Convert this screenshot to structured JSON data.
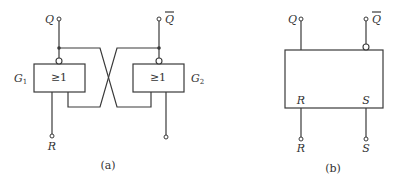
{
  "diagram_a": {
    "caption": "(a)",
    "gate1": {
      "label": "G",
      "subscript": "1",
      "symbol": "≥1"
    },
    "gate2": {
      "label": "G",
      "subscript": "2",
      "symbol": "≥1"
    },
    "output_q": "Q",
    "output_qbar": "Q",
    "input_r": "R"
  },
  "diagram_b": {
    "caption": "(b)",
    "output_q": "Q",
    "output_qbar": "Q",
    "inner_r": "R",
    "inner_s": "S",
    "input_r": "R",
    "input_s": "S"
  }
}
